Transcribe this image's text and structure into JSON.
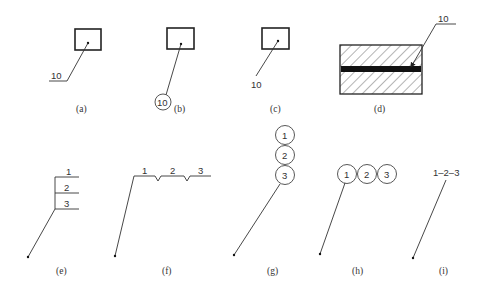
{
  "diagram": {
    "panels": [
      {
        "id": "a",
        "caption": "(a)",
        "label": "10",
        "style": "underlined number with leader to dot in box"
      },
      {
        "id": "b",
        "caption": "(b)",
        "label": "10",
        "style": "circled number with leader to dot in box"
      },
      {
        "id": "c",
        "caption": "(c)",
        "label": "10",
        "style": "plain number with leader to dot in box"
      },
      {
        "id": "d",
        "caption": "(d)",
        "label": "10",
        "style": "underlined number with arrow leader to black layer in hatched section"
      },
      {
        "id": "e",
        "caption": "(e)",
        "labels": [
          "1",
          "2",
          "3"
        ],
        "style": "stacked shelf labels"
      },
      {
        "id": "f",
        "caption": "(f)",
        "labels": [
          "1",
          "2",
          "3"
        ],
        "style": "inline labels separated by notches"
      },
      {
        "id": "g",
        "caption": "(g)",
        "labels": [
          "1",
          "2",
          "3"
        ],
        "style": "vertically stacked circled numbers"
      },
      {
        "id": "h",
        "caption": "(h)",
        "labels": [
          "1",
          "2",
          "3"
        ],
        "style": "horizontally chained circled numbers"
      },
      {
        "id": "i",
        "caption": "(i)",
        "label": "1–2–3",
        "style": "hyphenated range label"
      }
    ]
  }
}
